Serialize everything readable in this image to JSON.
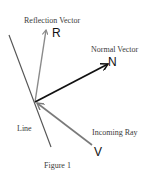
{
  "figure": {
    "caption": "Figure 1",
    "labels": {
      "reflection_vector": "Reflection Vector",
      "normal_vector": "Normal Vector",
      "incoming_ray": "Incoming Ray",
      "line": "Line"
    },
    "symbols": {
      "reflection": "R",
      "normal": "N",
      "incoming": "V"
    },
    "colors": {
      "line": "#555555",
      "reflection": "#8a8a8a",
      "normal": "#111111",
      "incoming": "#7a7a7a",
      "background": "#ffffff"
    }
  }
}
